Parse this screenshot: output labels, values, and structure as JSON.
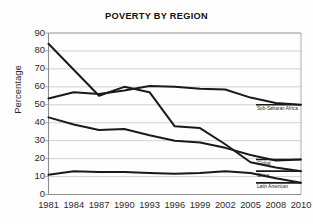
{
  "chart_data": {
    "type": "line",
    "title": "POVERTY BY REGION",
    "xlabel": "",
    "ylabel": "Percentage",
    "x": [
      1981,
      1984,
      1987,
      1990,
      1993,
      1996,
      1999,
      2002,
      2005,
      2008,
      2010
    ],
    "xticklabels": [
      "1981",
      "1984",
      "1987",
      "1990",
      "1993",
      "1996",
      "1999",
      "2002",
      "2005",
      "2008",
      "2010"
    ],
    "yticklabels": [
      "0",
      "10",
      "20",
      "30",
      "40",
      "50",
      "60",
      "70",
      "80",
      "90"
    ],
    "ylim": [
      0,
      90
    ],
    "ytick_step": 10,
    "grid": "horizontal",
    "legend_position": "right-inline-labels",
    "line_color": "#1a1a1a",
    "grid_color": "#b9b9b9",
    "series": [
      {
        "name": "China",
        "label": "China",
        "values": [
          84,
          69.5,
          55,
          60,
          57,
          38,
          37,
          28,
          18,
          15,
          13
        ]
      },
      {
        "name": "Sub-Saharan Africa",
        "label": "Sub-Saharan Africa",
        "values": [
          53.5,
          57,
          56,
          58,
          60.5,
          60,
          59,
          58.5,
          54,
          51,
          50
        ]
      },
      {
        "name": "Global",
        "label": "Global",
        "values": [
          43,
          39,
          36,
          36.5,
          33,
          30,
          29,
          26,
          22,
          19,
          19.5
        ]
      },
      {
        "name": "Latin American",
        "label": "Latin American",
        "values": [
          11,
          13,
          12.5,
          12.5,
          12,
          11.5,
          12,
          13,
          12,
          9,
          6.5
        ]
      }
    ]
  }
}
